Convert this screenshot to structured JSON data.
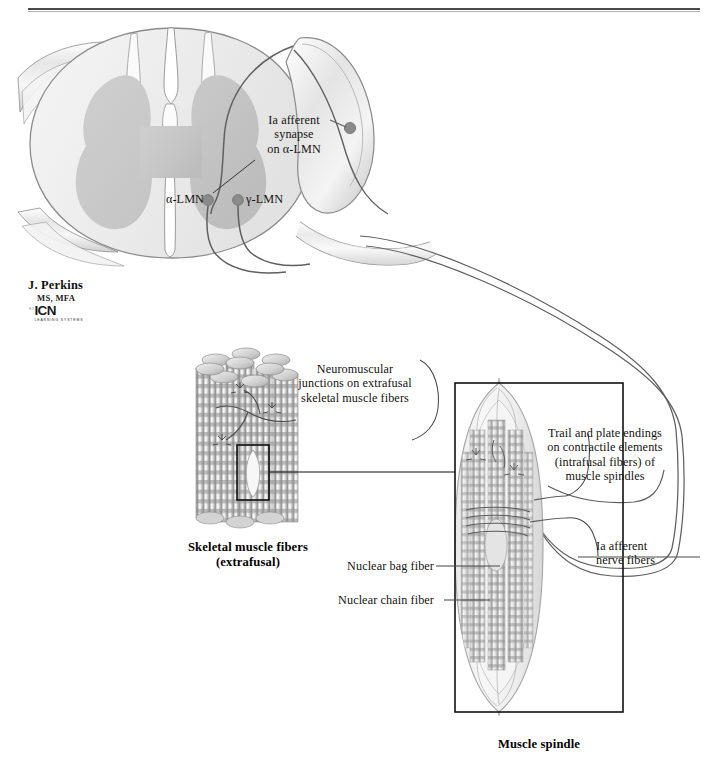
{
  "figure": {
    "colors": {
      "white_matter": "#ececec",
      "gray_matter": "#c9c9c9",
      "outline": "#7d7d7d",
      "nerve_line": "#5f5f5f",
      "neuron_dot": "#808080",
      "text": "#15120f",
      "rule": "#4a4a4a",
      "box": "#111111",
      "muscle_light": "#f2f2f2",
      "muscle_dark": "#9a9a9a"
    }
  },
  "header": {
    "rule_present": true
  },
  "labels": {
    "ia_afferent_synapse": "Ia afferent\nsynapse\non α-LMN",
    "alpha_lmn": "α-LMN",
    "gamma_lmn": "γ-LMN",
    "neuromuscular_junctions": "Neuromuscular\njunctions on extrafusal\nskeletal muscle fibers",
    "trail_and_plate": "Trail and plate endings\non contractile elements\n(intrafusal fibers) of\nmuscle spindles",
    "ia_afferent_nerve_fibers": "Ia afferent\nnerve fibers",
    "nuclear_bag_fiber": "Nuclear bag fiber",
    "nuclear_chain_fiber": "Nuclear chain fiber"
  },
  "captions": {
    "skeletal_muscle_fibers": "Skeletal muscle fibers\n(extrafusal)",
    "muscle_spindle": "Muscle spindle"
  },
  "credit": {
    "artist": "J. Perkins",
    "degrees": "MS, MFA",
    "copyright": "©",
    "logo_text": "ICN",
    "logo_sub": "LEARNING\nSYSTEMS"
  },
  "structures": {
    "spinal_cord": "spinal-cord-cross-section",
    "dorsal_root_ganglion": "dorsal-root-ganglion",
    "muscle_bundle": "extrafusal-muscle-fiber-bundle",
    "spindle": "muscle-spindle"
  }
}
